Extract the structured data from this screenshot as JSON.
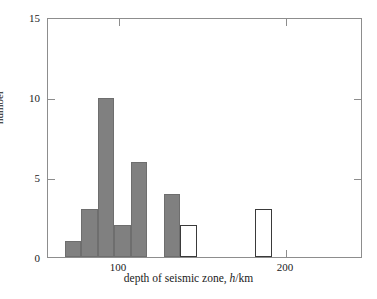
{
  "chart_data": {
    "type": "bar",
    "title": "",
    "subtitle": "",
    "xlabel": "depth of seismic zone, h/km",
    "xlabel_parts": {
      "before": "depth of seismic zone, ",
      "italic": "h",
      "after": "/km"
    },
    "ylabel": "number",
    "xlim": [
      70,
      259
    ],
    "ylim": [
      0,
      15
    ],
    "xticks": [
      100,
      200
    ],
    "xtick_labels": [
      "100",
      "200"
    ],
    "yticks": [
      0,
      5,
      10,
      15
    ],
    "ytick_labels": [
      "0",
      "5",
      "10",
      "15"
    ],
    "grid": false,
    "legend": "none",
    "bin_width": 10,
    "bars": [
      {
        "name": "bin-80-90",
        "x0": 80,
        "x1": 90,
        "value": 1,
        "style": "filled"
      },
      {
        "name": "bin-90-100",
        "x0": 90,
        "x1": 100,
        "value": 3,
        "style": "filled"
      },
      {
        "name": "bin-100-110",
        "x0": 100,
        "x1": 110,
        "value": 10,
        "style": "filled"
      },
      {
        "name": "bin-110-120",
        "x0": 110,
        "x1": 120,
        "value": 2,
        "style": "filled"
      },
      {
        "name": "bin-120-130",
        "x0": 120,
        "x1": 130,
        "value": 6,
        "style": "filled"
      },
      {
        "name": "bin-140-150",
        "x0": 140,
        "x1": 150,
        "value": 4,
        "style": "filled"
      },
      {
        "name": "bin-150-160-filled",
        "x0": 150,
        "x1": 160,
        "value": 1,
        "style": "filled"
      },
      {
        "name": "bin-150-160-open",
        "x0": 150,
        "x1": 160,
        "value": 2,
        "style": "open"
      },
      {
        "name": "bin-195-205-open",
        "x0": 195,
        "x1": 205,
        "value": 3,
        "style": "open"
      }
    ],
    "colors": {
      "filled": "#808080",
      "open_fill": "#ffffff",
      "open_stroke": "#3a3a3a",
      "axis": "#8d8d8d",
      "text": "#1a1a1a",
      "background": "#ffffff"
    }
  }
}
